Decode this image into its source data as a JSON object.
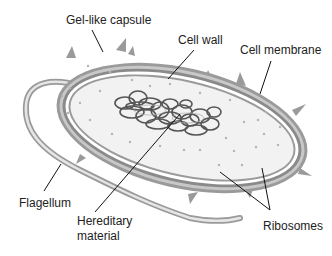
{
  "diagram": {
    "labels": {
      "capsule": "Gel-like capsule",
      "cell_wall": "Cell wall",
      "cell_membrane": "Cell membrane",
      "flagellum": "Flagellum",
      "hereditary_1": "Hereditary",
      "hereditary_2": "material",
      "ribosomes": "Ribosomes"
    },
    "colors": {
      "capsule": "#9a9a9a",
      "wall": "#8a8a8a",
      "membrane_gap": "#ffffff",
      "cytoplasm": "#f2f2f2",
      "dna": "#555555",
      "leader": "#111111"
    }
  }
}
